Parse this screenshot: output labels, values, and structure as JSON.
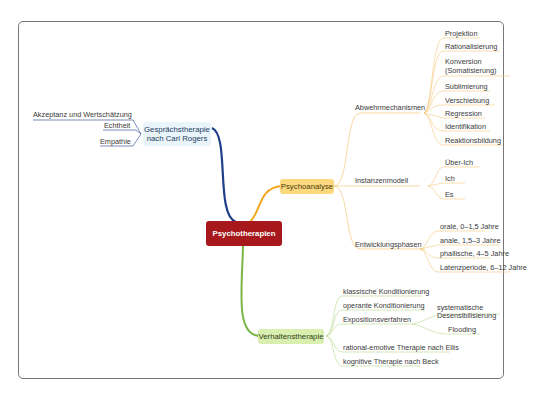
{
  "central": {
    "label": "Psychotherapien",
    "color": "#a6181b"
  },
  "branches": {
    "gespraech": {
      "label_line1": "Gesprächstherapie",
      "label_line2": "nach Carl Rogers",
      "color": "#1f3e8a",
      "children": [
        "Akzeptanz und Wertschätzung",
        "Echtheit",
        "Empathie"
      ]
    },
    "psycho": {
      "label": "Psychoanalyse",
      "color": "#f5a623",
      "groups": [
        {
          "label": "Abwehrmechanismen",
          "children": [
            "Projektion",
            "Rationalisierung",
            "Konversion",
            "(Somatisierung)",
            "Sublimierung",
            "Verschiebung",
            "Regression",
            "Identifikation",
            "Reaktionsbildung"
          ]
        },
        {
          "label": "Instanzenmodell",
          "children": [
            "Über-Ich",
            "Ich",
            "Es"
          ]
        },
        {
          "label": "Entwicklungsphasen",
          "children": [
            "orale, 0–1,5 Jahre",
            "anale, 1,5–3 Jahre",
            "phallische, 4–5 Jahre",
            "Latenzperiode, 6–12 Jahre"
          ]
        }
      ]
    },
    "verhalten": {
      "label": "Verhaltenstherapie",
      "color": "#7ab648",
      "children": [
        "klassische Konditionierung",
        "operante Konditionierung",
        "Expositionsverfahren",
        "rational-emotive Therapie nach Ellis",
        "kognitive Therapie nach Beck"
      ],
      "exposition_children": [
        "systematische",
        "Desensibilisierung",
        "Flooding"
      ]
    }
  }
}
